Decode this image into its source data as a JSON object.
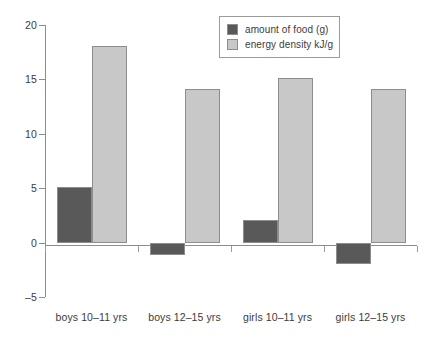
{
  "chart_data": {
    "type": "bar",
    "title": "",
    "xlabel": "",
    "ylabel": "",
    "ylim": [
      -5,
      20
    ],
    "ytick_labels": [
      "20",
      "15",
      "10",
      "5",
      "0",
      "-5"
    ],
    "yticks": [
      20,
      15,
      10,
      5,
      0,
      -5
    ],
    "grid": false,
    "legend_position": "top-right",
    "categories": [
      "boys 10–11 yrs",
      "boys 12–15 yrs",
      "girls 10–11 yrs",
      "girls 12–15 yrs"
    ],
    "series": [
      {
        "name": "amount of food (g)",
        "color": "#595959",
        "values": [
          5.1,
          -1.1,
          2.1,
          -2.0
        ]
      },
      {
        "name": "energy density kJ/g",
        "color": "#c8c8c8",
        "values": [
          18.1,
          14.1,
          15.1,
          14.1
        ]
      }
    ]
  },
  "legend": {
    "items": [
      {
        "label": "amount of food (g)",
        "swatch_name": "legend-swatch-amount-of-food"
      },
      {
        "label": "energy density kJ/g",
        "swatch_name": "legend-swatch-energy-density"
      }
    ]
  },
  "colors": {
    "series_dark": "#595959",
    "series_light": "#c8c8c8",
    "axis": "#8d8d8d",
    "text": "#3b3b3b",
    "background": "#ffffff"
  }
}
